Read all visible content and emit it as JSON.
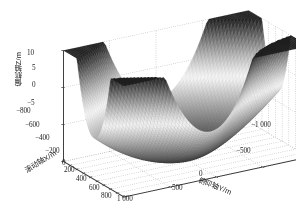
{
  "chart_data": {
    "type": "surface",
    "title": "",
    "subtitle": "",
    "render_style": "mesh-grayscale",
    "background": "#ffffff",
    "grid": true,
    "grid_style": "dotted",
    "legend": null,
    "colormap": "grayscale",
    "surface_color_dark": "#2b2b2b",
    "surface_color_light": "#e8e8e8",
    "axis_line_color": "#4a4a4a",
    "grid_color": "#9a9a9a",
    "view": {
      "azimuth": -37.5,
      "elevation": 30
    },
    "xlabel": "滚动轴X/m",
    "ylabel": "俯仰轴Y/m",
    "zlabel": "偏航轴Z/m",
    "xlim": [
      -800,
      1000
    ],
    "ylim": [
      -1000,
      1000
    ],
    "zlim": [
      -5,
      10
    ],
    "xticks": [
      -800,
      -600,
      -400,
      -200,
      0,
      200,
      400,
      600,
      800,
      1000
    ],
    "xticklabels": [
      "-800",
      "-600",
      "-400",
      "-200",
      "0",
      "200",
      "400",
      "600",
      "800",
      "1 000"
    ],
    "yticks": [
      -1000,
      -500,
      0,
      500
    ],
    "yticklabels": [
      "-1 000",
      "-500",
      "0",
      "500"
    ],
    "zticks": [
      -5,
      0,
      5,
      10
    ],
    "zticklabels": [
      "-5",
      "0",
      "5",
      "10"
    ],
    "surface": {
      "nx": 70,
      "ny": 70,
      "z_min": -5,
      "z_max": 10,
      "basin_center_x": 100,
      "basin_center_y": 0,
      "peaks": [
        {
          "label": "back-center-peak",
          "x": 1000,
          "y": -1000,
          "z": 10
        },
        {
          "label": "left-cusp",
          "x": -800,
          "y": 1000,
          "z": 6
        },
        {
          "label": "right-cusp",
          "x": 1000,
          "y": 1000,
          "z": 4
        }
      ]
    }
  },
  "axes": {
    "z_ticks": [
      {
        "label": "10",
        "left": 27,
        "top": 50
      },
      {
        "label": "5",
        "left": 32,
        "top": 65
      },
      {
        "label": "0",
        "left": 32,
        "top": 82
      },
      {
        "label": "-5",
        "left": 27,
        "top": 100
      }
    ],
    "x_ticks": [
      {
        "label": "-800",
        "left": 16,
        "top": 108
      },
      {
        "label": "-600",
        "left": 25,
        "top": 122
      },
      {
        "label": "-400",
        "left": 35,
        "top": 135
      },
      {
        "label": "-200",
        "left": 45,
        "top": 148
      },
      {
        "label": "0",
        "left": 62,
        "top": 160
      },
      {
        "label": "200",
        "left": 64,
        "top": 167
      },
      {
        "label": "400",
        "left": 76,
        "top": 176
      },
      {
        "label": "600",
        "left": 89,
        "top": 185
      },
      {
        "label": "800",
        "left": 101,
        "top": 193
      },
      {
        "label": "1 000",
        "left": 117,
        "top": 196
      }
    ],
    "y_ticks": [
      {
        "label": "-1 000",
        "left": 251,
        "top": 122
      },
      {
        "label": "-500",
        "left": 236,
        "top": 148
      },
      {
        "label": "0",
        "left": 199,
        "top": 171
      },
      {
        "label": "500",
        "left": 172,
        "top": 185
      }
    ]
  }
}
